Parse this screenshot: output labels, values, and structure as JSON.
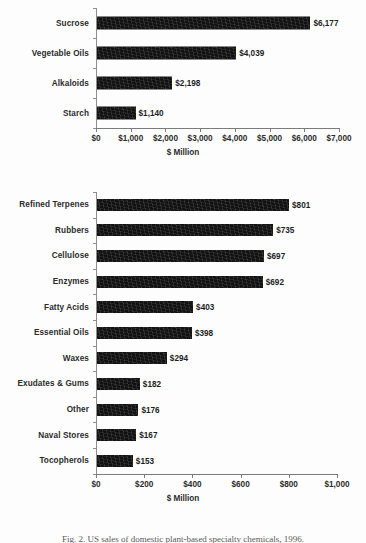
{
  "figure": {
    "caption": "Fig. 2. US sales of domestic plant-based specialty chemicals, 1996."
  },
  "chart_data": [
    {
      "type": "bar",
      "orientation": "horizontal",
      "title": "",
      "xlabel": "$ Million",
      "ylabel": "",
      "xlim": [
        0,
        7000
      ],
      "xticks": [
        0,
        1000,
        2000,
        3000,
        4000,
        5000,
        6000,
        7000
      ],
      "xticklabels": [
        "$0",
        "$1,000",
        "$2,000",
        "$3,000",
        "$4,000",
        "$5,000",
        "$6,000",
        "$7,000"
      ],
      "grid": false,
      "legend": false,
      "categories": [
        "Sucrose",
        "Vegetable Oils",
        "Alkaloids",
        "Starch"
      ],
      "values": [
        6177,
        4039,
        2198,
        1140
      ],
      "data_labels": [
        "$6,177",
        "$4,039",
        "$2,198",
        "$1,140"
      ],
      "bar_color": "#111111"
    },
    {
      "type": "bar",
      "orientation": "horizontal",
      "title": "",
      "xlabel": "$ Million",
      "ylabel": "",
      "xlim": [
        0,
        1000
      ],
      "xticks": [
        0,
        200,
        400,
        600,
        800,
        1000
      ],
      "xticklabels": [
        "$0",
        "$200",
        "$400",
        "$600",
        "$800",
        "$1,000"
      ],
      "grid": false,
      "legend": false,
      "categories": [
        "Refined Terpenes",
        "Rubbers",
        "Cellulose",
        "Enzymes",
        "Fatty Acids",
        "Essential Oils",
        "Waxes",
        "Exudates & Gums",
        "Other",
        "Naval Stores",
        "Tocopherols"
      ],
      "values": [
        801,
        735,
        697,
        692,
        403,
        398,
        294,
        182,
        176,
        167,
        153
      ],
      "data_labels": [
        "$801",
        "$735",
        "$697",
        "$692",
        "$403",
        "$398",
        "$294",
        "$182",
        "$176",
        "$167",
        "$153"
      ],
      "bar_color": "#111111"
    }
  ]
}
